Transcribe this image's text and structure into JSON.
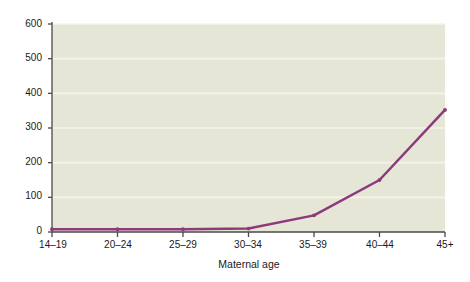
{
  "chart_data": {
    "type": "line",
    "title": "",
    "subtitle": "",
    "xlabel": "Maternal age",
    "ylabel": "Prevalence per 10,000 births",
    "categories": [
      "14–19",
      "20–24",
      "25–29",
      "30–34",
      "35–39",
      "40–44",
      "45+"
    ],
    "values": [
      8,
      8,
      8,
      10,
      48,
      150,
      352
    ],
    "series": [
      {
        "name": "Prevalence",
        "values": [
          8,
          8,
          8,
          10,
          48,
          150,
          352
        ],
        "color": "#8b3a7c"
      }
    ],
    "ylim": [
      0,
      600
    ],
    "yticks": [
      0,
      100,
      200,
      300,
      400,
      500,
      600
    ],
    "ytick_labels": [
      "0",
      "100",
      "200",
      "300",
      "400",
      "500",
      "600"
    ],
    "xtick_labels": [
      "14–19",
      "20–24",
      "25–29",
      "30–34",
      "35–39",
      "40–44",
      "45+"
    ],
    "grid": true,
    "grid_axis": "y",
    "grid_color": "#f4f4ea",
    "legend": false,
    "legend_position": "none",
    "plot_background": "#e6e6d6",
    "figure_background": "#ffffff",
    "axis_color": "#4a4a4a",
    "line_color": "#8b3a7c",
    "line_width": 2.5,
    "marker": "vertex-dot",
    "annotations": []
  },
  "axes": {
    "y": {
      "label": "Prevalence per 10,000 births",
      "ticks": [
        {
          "value": 600,
          "label": "600"
        },
        {
          "value": 500,
          "label": "500"
        },
        {
          "value": 400,
          "label": "400"
        },
        {
          "value": 300,
          "label": "300"
        },
        {
          "value": 200,
          "label": "200"
        },
        {
          "value": 100,
          "label": "100"
        },
        {
          "value": 0,
          "label": "0"
        }
      ]
    },
    "x": {
      "label": "Maternal age",
      "ticks": [
        {
          "label": "14–19"
        },
        {
          "label": "20–24"
        },
        {
          "label": "25–29"
        },
        {
          "label": "30–34"
        },
        {
          "label": "35–39"
        },
        {
          "label": "40–44"
        },
        {
          "label": "45+"
        }
      ]
    }
  }
}
